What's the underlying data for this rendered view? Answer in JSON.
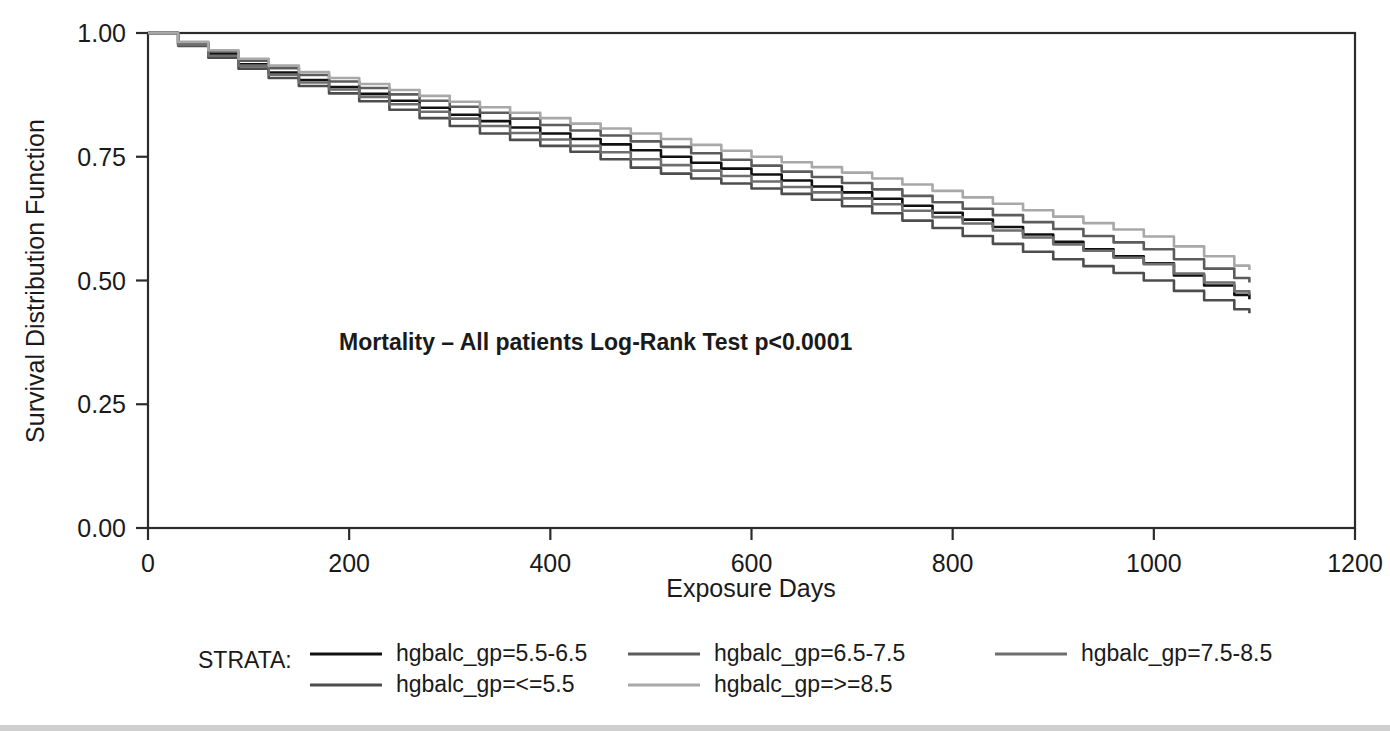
{
  "chart_data": {
    "type": "line",
    "title": "",
    "xlabel": "Exposure Days",
    "ylabel": "Survival Distribution Function",
    "xlim": [
      0,
      1200
    ],
    "ylim": [
      0.0,
      1.0
    ],
    "grid": false,
    "legend_position": "bottom",
    "xticks": [
      "0",
      "200",
      "400",
      "600",
      "800",
      "1000",
      "1200"
    ],
    "xtick_values": [
      0,
      200,
      400,
      600,
      800,
      1000,
      1200
    ],
    "yticks": [
      "0.00",
      "0.25",
      "0.50",
      "0.75",
      "1.00"
    ],
    "ytick_values": [
      0.0,
      0.25,
      0.5,
      0.75,
      1.0
    ],
    "annotations": [
      {
        "text": "Mortality – All patients    Log-Rank Test p<0.0001",
        "x": 190,
        "y": 0.36,
        "bold": true
      }
    ],
    "legend_title": "STRATA:",
    "series": [
      {
        "name": "hgbalc_gp=5.5-6.5",
        "color": "#111111",
        "x": [
          0,
          30,
          60,
          90,
          120,
          150,
          180,
          210,
          240,
          270,
          300,
          330,
          360,
          390,
          420,
          450,
          480,
          510,
          540,
          570,
          600,
          630,
          660,
          690,
          720,
          750,
          780,
          810,
          840,
          870,
          900,
          930,
          960,
          990,
          1020,
          1050,
          1080,
          1095
        ],
        "y": [
          1.0,
          0.978,
          0.957,
          0.937,
          0.92,
          0.905,
          0.891,
          0.877,
          0.863,
          0.849,
          0.835,
          0.822,
          0.809,
          0.797,
          0.786,
          0.775,
          0.763,
          0.75,
          0.738,
          0.726,
          0.714,
          0.702,
          0.69,
          0.678,
          0.665,
          0.651,
          0.637,
          0.623,
          0.608,
          0.593,
          0.578,
          0.563,
          0.549,
          0.535,
          0.51,
          0.49,
          0.471,
          0.462
        ]
      },
      {
        "name": "hgbalc_gp=<=5.5",
        "color": "#4d4d4d",
        "x": [
          0,
          30,
          60,
          90,
          120,
          150,
          180,
          210,
          240,
          270,
          300,
          330,
          360,
          390,
          420,
          450,
          480,
          510,
          540,
          570,
          600,
          630,
          660,
          690,
          720,
          750,
          780,
          810,
          840,
          870,
          900,
          930,
          960,
          990,
          1020,
          1050,
          1080,
          1095
        ],
        "y": [
          1.0,
          0.974,
          0.95,
          0.928,
          0.909,
          0.893,
          0.878,
          0.862,
          0.845,
          0.828,
          0.812,
          0.797,
          0.784,
          0.772,
          0.76,
          0.745,
          0.728,
          0.716,
          0.706,
          0.696,
          0.686,
          0.675,
          0.663,
          0.65,
          0.636,
          0.621,
          0.606,
          0.59,
          0.574,
          0.558,
          0.543,
          0.529,
          0.515,
          0.5,
          0.479,
          0.46,
          0.442,
          0.434
        ]
      },
      {
        "name": "hgbalc_gp=6.5-7.5",
        "color": "#5c5c5c",
        "x": [
          0,
          30,
          60,
          90,
          120,
          150,
          180,
          210,
          240,
          270,
          300,
          330,
          360,
          390,
          420,
          450,
          480,
          510,
          540,
          570,
          600,
          630,
          660,
          690,
          720,
          750,
          780,
          810,
          840,
          870,
          900,
          930,
          960,
          990,
          1020,
          1050,
          1080,
          1095
        ],
        "y": [
          1.0,
          0.98,
          0.962,
          0.944,
          0.929,
          0.915,
          0.902,
          0.889,
          0.876,
          0.863,
          0.851,
          0.839,
          0.827,
          0.814,
          0.803,
          0.793,
          0.781,
          0.77,
          0.757,
          0.744,
          0.732,
          0.72,
          0.709,
          0.697,
          0.684,
          0.671,
          0.658,
          0.645,
          0.632,
          0.618,
          0.604,
          0.59,
          0.577,
          0.563,
          0.543,
          0.524,
          0.505,
          0.496
        ]
      },
      {
        "name": "hgbalc_gp=7.5-8.5",
        "color": "#6e6e6e",
        "x": [
          0,
          30,
          60,
          90,
          120,
          150,
          180,
          210,
          240,
          270,
          300,
          330,
          360,
          390,
          420,
          450,
          480,
          510,
          540,
          570,
          600,
          630,
          660,
          690,
          720,
          750,
          780,
          810,
          840,
          870,
          900,
          930,
          960,
          990,
          1020,
          1050,
          1080,
          1095
        ],
        "y": [
          1.0,
          0.976,
          0.954,
          0.934,
          0.916,
          0.9,
          0.886,
          0.871,
          0.856,
          0.841,
          0.827,
          0.812,
          0.798,
          0.785,
          0.772,
          0.759,
          0.745,
          0.733,
          0.722,
          0.711,
          0.7,
          0.689,
          0.678,
          0.666,
          0.654,
          0.641,
          0.628,
          0.615,
          0.601,
          0.587,
          0.573,
          0.56,
          0.546,
          0.533,
          0.514,
          0.496,
          0.478,
          0.47
        ]
      },
      {
        "name": "hgbalc_gp=>=8.5",
        "color": "#a8a8a8",
        "x": [
          0,
          30,
          60,
          90,
          120,
          150,
          180,
          210,
          240,
          270,
          300,
          330,
          360,
          390,
          420,
          450,
          480,
          510,
          540,
          570,
          600,
          630,
          660,
          690,
          720,
          750,
          780,
          810,
          840,
          870,
          900,
          930,
          960,
          990,
          1020,
          1050,
          1080,
          1095
        ],
        "y": [
          1.0,
          0.982,
          0.965,
          0.948,
          0.934,
          0.921,
          0.909,
          0.897,
          0.885,
          0.873,
          0.861,
          0.85,
          0.839,
          0.828,
          0.817,
          0.807,
          0.797,
          0.786,
          0.774,
          0.762,
          0.75,
          0.739,
          0.729,
          0.718,
          0.706,
          0.694,
          0.681,
          0.668,
          0.655,
          0.642,
          0.629,
          0.616,
          0.603,
          0.589,
          0.569,
          0.549,
          0.53,
          0.521
        ]
      }
    ]
  },
  "legend": {
    "title": "STRATA:",
    "entries": [
      {
        "label": "hgbalc_gp=5.5-6.5",
        "color": "#111111",
        "col": 0,
        "row": 0
      },
      {
        "label": "hgbalc_gp=6.5-7.5",
        "color": "#5c5c5c",
        "col": 1,
        "row": 0
      },
      {
        "label": "hgbalc_gp=7.5-8.5",
        "color": "#6e6e6e",
        "col": 2,
        "row": 0
      },
      {
        "label": "hgbalc_gp=<=5.5",
        "color": "#4d4d4d",
        "col": 0,
        "row": 1
      },
      {
        "label": "hgbalc_gp=>=8.5",
        "color": "#a8a8a8",
        "col": 1,
        "row": 1
      }
    ]
  }
}
